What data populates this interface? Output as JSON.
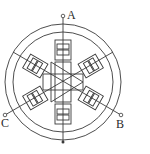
{
  "diagram": {
    "type": "three-phase variable reluctance stepper motor",
    "phases": [
      {
        "label": "A",
        "angle_deg": 90
      },
      {
        "label": "B",
        "angle_deg": -30
      },
      {
        "label": "C",
        "angle_deg": 210
      }
    ],
    "stator_poles": 6,
    "rotor_teeth": 4,
    "colors": {
      "line": "#3a3a3a",
      "background": "#ffffff"
    }
  }
}
